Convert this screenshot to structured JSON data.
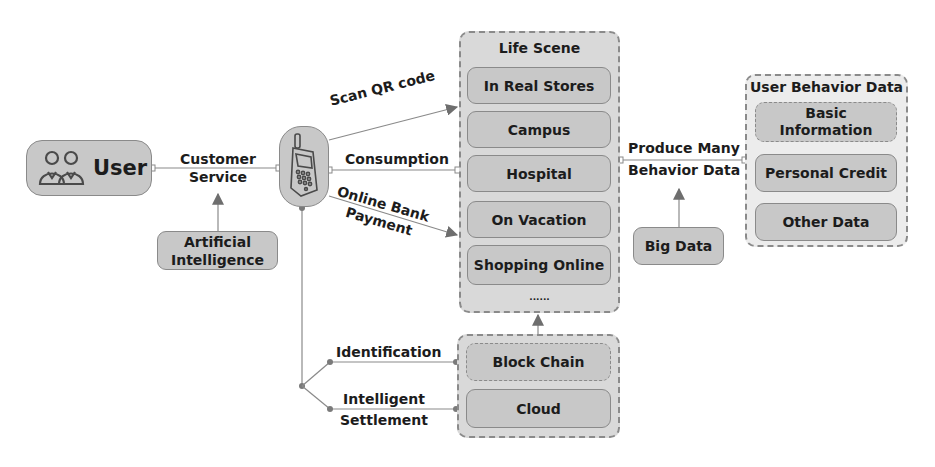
{
  "nodes": {
    "user": "User",
    "ai": "Artificial Intelligence",
    "big_data": "Big Data"
  },
  "life_scene": {
    "title": "Life Scene",
    "items": [
      "In Real Stores",
      "Campus",
      "Hospital",
      "On Vacation",
      "Shopping Online"
    ],
    "ellipsis": "......"
  },
  "user_behavior": {
    "title": "User Behavior Data",
    "items": [
      "Basic Information",
      "Personal Credit",
      "Other Data"
    ]
  },
  "tech": {
    "items": [
      "Block Chain",
      "Cloud"
    ]
  },
  "edges": {
    "customer_service": [
      "Customer",
      "Service"
    ],
    "scan_qr": "Scan QR code",
    "consumption": "Consumption",
    "online_bank": [
      "Online Bank",
      "Payment"
    ],
    "produce": [
      "Produce Many",
      "Behavior Data"
    ],
    "identification": "Identification",
    "settlement": [
      "Intelligent",
      "Settlement"
    ]
  },
  "colors": {
    "node_fill": "#c8c8c8",
    "group_fill": "#d9d9d9",
    "stroke": "#8a8a8a",
    "arrow": "#6e6e6e"
  }
}
